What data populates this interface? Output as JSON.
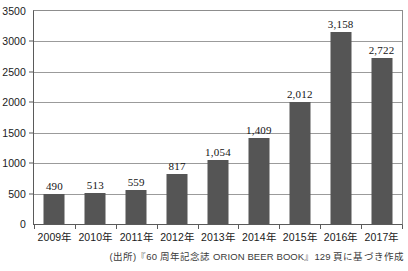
{
  "chart_data": {
    "type": "bar",
    "title": "",
    "subtitle": "",
    "xlabel": "",
    "ylabel": "",
    "categories": [
      "2009年",
      "2010年",
      "2011年",
      "2012年",
      "2013年",
      "2014年",
      "2015年",
      "2016年",
      "2017年"
    ],
    "values": [
      490,
      513,
      559,
      817,
      1054,
      1409,
      2012,
      3158,
      2722
    ],
    "value_labels": [
      "490",
      "513",
      "559",
      "817",
      "1,054",
      "1,409",
      "2,012",
      "3,158",
      "2,722"
    ],
    "ylim": [
      0,
      3500
    ],
    "ytick_values": [
      0,
      500,
      1000,
      1500,
      2000,
      2500,
      3000,
      3500
    ],
    "ytick_labels": [
      "0",
      "500",
      "1000",
      "1500",
      "2000",
      "2500",
      "3000",
      "3500"
    ],
    "grid": true,
    "grid_axis": "y",
    "legend": false,
    "legend_position": "none",
    "bar_color": "#555555",
    "gridline_color": "#9b9b9b",
    "axis_color": "#5a5a5a",
    "text_color": "#1a1a1a",
    "series": [
      {
        "name": "",
        "values": [
          490,
          513,
          559,
          817,
          1054,
          1409,
          2012,
          3158,
          2722
        ]
      }
    ]
  },
  "source_note": "(出所)『60 周年記念誌 ORION BEER BOOK』129 頁に基づき作成"
}
